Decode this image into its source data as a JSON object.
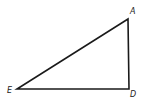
{
  "figure": {
    "type": "right-triangle",
    "vertices": {
      "A": {
        "label": "A",
        "x": 128,
        "y": 19
      },
      "D": {
        "label": "D",
        "x": 129,
        "y": 89
      },
      "E": {
        "label": "E",
        "x": 17,
        "y": 89
      }
    },
    "right_angle_at": "D",
    "stroke_color": "#1a1a1a",
    "background": "#ffffff"
  }
}
